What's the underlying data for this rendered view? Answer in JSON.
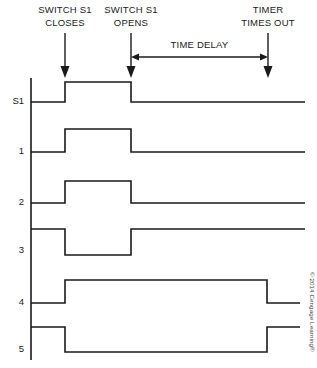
{
  "figure": {
    "type": "timing-diagram",
    "title_visible": false,
    "credit": "© 2014 Cengage Learning®",
    "background_color": "#ffffff",
    "line_color": "#1a1a1a"
  },
  "annotations": {
    "switch_closes": {
      "line1": "SWITCH S1",
      "line2": "CLOSES",
      "x": 65
    },
    "switch_opens": {
      "line1": "SWITCH S1",
      "line2": "OPENS",
      "x": 131
    },
    "timer_times_out": {
      "line1": "TIMER",
      "line2": "TIMES OUT",
      "x": 268
    },
    "time_delay": {
      "label": "TIME DELAY",
      "from_x": 131,
      "to_x": 268
    }
  },
  "axis": {
    "x": 31,
    "y_top": 78,
    "y_bottom": 360
  },
  "chart_data": {
    "type": "timing-diagram",
    "xlabel": "",
    "ylabel": "",
    "grid": false,
    "legend": "none",
    "x_events": [
      {
        "name": "switch-s1-closes",
        "x": 65
      },
      {
        "name": "switch-s1-opens",
        "x": 131
      },
      {
        "name": "timer-times-out",
        "x": 268
      }
    ],
    "x_start": 31,
    "x_end": 305,
    "series": [
      {
        "name": "S1",
        "label": "S1",
        "label_y": 104,
        "y_low": 102,
        "y_high": 82,
        "initial_state": "low",
        "x_end": 305,
        "transitions": [
          {
            "x": 65,
            "to": "high"
          },
          {
            "x": 131,
            "to": "low"
          }
        ]
      },
      {
        "name": "1",
        "label": "1",
        "label_y": 154,
        "y_low": 152,
        "y_high": 129,
        "initial_state": "low",
        "x_end": 305,
        "transitions": [
          {
            "x": 65,
            "to": "high"
          },
          {
            "x": 131,
            "to": "low"
          }
        ]
      },
      {
        "name": "2",
        "label": "2",
        "label_y": 205,
        "y_low": 203,
        "y_high": 181,
        "initial_state": "low",
        "x_end": 305,
        "transitions": [
          {
            "x": 65,
            "to": "high"
          },
          {
            "x": 131,
            "to": "low"
          }
        ]
      },
      {
        "name": "3",
        "label": "3",
        "label_y": 253,
        "y_low": 255,
        "y_high": 229,
        "initial_state": "high",
        "x_end": 305,
        "transitions": [
          {
            "x": 65,
            "to": "low"
          },
          {
            "x": 131,
            "to": "high"
          }
        ]
      },
      {
        "name": "4",
        "label": "4",
        "label_y": 305,
        "y_low": 303,
        "y_high": 280,
        "initial_state": "low",
        "x_end": 300,
        "transitions": [
          {
            "x": 65,
            "to": "high"
          },
          {
            "x": 267,
            "to": "low"
          }
        ]
      },
      {
        "name": "5",
        "label": "5",
        "label_y": 352,
        "y_low": 352,
        "y_high": 327,
        "initial_state": "high",
        "x_end": 300,
        "transitions": [
          {
            "x": 65,
            "to": "low"
          },
          {
            "x": 267,
            "to": "high"
          }
        ]
      }
    ]
  }
}
